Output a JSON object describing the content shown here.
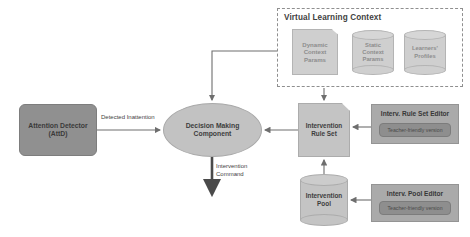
{
  "diagram": {
    "nodes": {
      "attention_detector": {
        "label_line1": "Attention Detector",
        "label_line2": "(AttD)"
      },
      "decision_making": {
        "label_line1": "Decision Making",
        "label_line2": "Component"
      },
      "intervention_rule_set": {
        "label_line1": "Intervention",
        "label_line2": "Rule Set"
      },
      "intervention_pool": {
        "label_line1": "Intervention",
        "label_line2": "Pool"
      },
      "dynamic_context_params": {
        "label_line1": "Dynamic",
        "label_line2": "Context",
        "label_line3": "Params"
      },
      "static_context_params": {
        "label_line1": "Static",
        "label_line2": "Context",
        "label_line3": "Params"
      },
      "learners_profiles": {
        "label_line1": "Learners'",
        "label_line2": "Profiles"
      }
    },
    "groups": {
      "virtual_learning_context": {
        "title": "Virtual Learning Context"
      }
    },
    "editors": {
      "rule_set_editor": {
        "title": "Interv. Rule Set Editor",
        "inner_label": "Teacher-friendly version"
      },
      "pool_editor": {
        "title": "Interv. Pool Editor",
        "inner_label": "Teacher-friendly version"
      }
    },
    "edges": {
      "detected_inattention": {
        "label": "Detected Inattention"
      },
      "intervention_command": {
        "label_line1": "Intervention",
        "label_line2": "Command"
      }
    },
    "colors": {
      "background": "#ffffff",
      "detector_fill": "#909090",
      "ellipse_fill": "#c2c2c2",
      "node_fill": "#c4c4c4",
      "context_fill": "#cfcfcf",
      "editor_fill": "#aaaaaa",
      "editor_inner_fill": "#8e8e8e",
      "stroke": "#8f8f8f",
      "text": "#3d3d3d"
    }
  }
}
